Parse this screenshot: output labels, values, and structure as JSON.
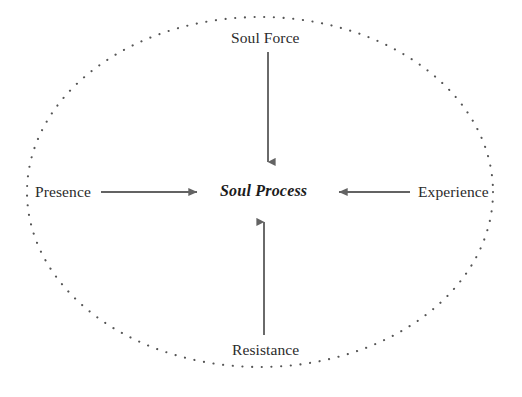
{
  "diagram": {
    "title": "Soul Process",
    "type": "centered-influence-diagram",
    "boundary": {
      "shape": "ellipse",
      "style": "dotted",
      "color": "#555555",
      "center_x": 260,
      "center_y": 192,
      "radius_x": 233,
      "radius_y": 175
    },
    "center_node": {
      "label": "Soul Process",
      "style": "bold-italic",
      "color": "#1c1c1c",
      "x": 264,
      "y": 192
    },
    "nodes": [
      {
        "id": "soul-force",
        "label": "Soul Force",
        "position": "top",
        "x": 268,
        "y": 38,
        "color": "#2b2b2b"
      },
      {
        "id": "presence",
        "label": "Presence",
        "position": "left",
        "x": 66,
        "y": 192,
        "color": "#2b2b2b"
      },
      {
        "id": "experience",
        "label": "Experience",
        "position": "right",
        "x": 455,
        "y": 192,
        "color": "#2b2b2b"
      },
      {
        "id": "resistance",
        "label": "Resistance",
        "position": "bottom",
        "x": 268,
        "y": 350,
        "color": "#2b2b2b"
      }
    ],
    "arrows": [
      {
        "id": "arrow-soul-force-to-center",
        "from": "soul-force",
        "to": "soul-process",
        "direction": "down",
        "color": "#636363",
        "x1": 268,
        "y1": 52,
        "x2": 268,
        "y2": 170
      },
      {
        "id": "arrow-presence-to-center",
        "from": "presence",
        "to": "soul-process",
        "direction": "right",
        "color": "#636363",
        "x1": 101,
        "y1": 192,
        "x2": 206,
        "y2": 192
      },
      {
        "id": "arrow-experience-to-center",
        "from": "experience",
        "to": "soul-process",
        "direction": "left",
        "color": "#636363",
        "x1": 410,
        "y1": 192,
        "x2": 330,
        "y2": 192
      },
      {
        "id": "arrow-resistance-to-center",
        "from": "resistance",
        "to": "soul-process",
        "direction": "up",
        "color": "#636363",
        "x1": 264,
        "y1": 335,
        "x2": 264,
        "y2": 214
      }
    ]
  }
}
